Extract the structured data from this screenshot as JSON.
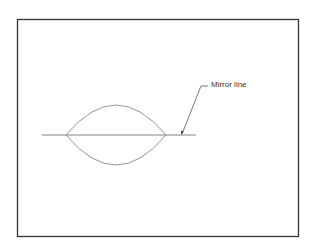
{
  "diagram": {
    "annotation": {
      "label": "Mirror line"
    },
    "colors": {
      "frame": "#333333",
      "shape": "#888888",
      "line": "#777777",
      "text": "#333333"
    }
  }
}
